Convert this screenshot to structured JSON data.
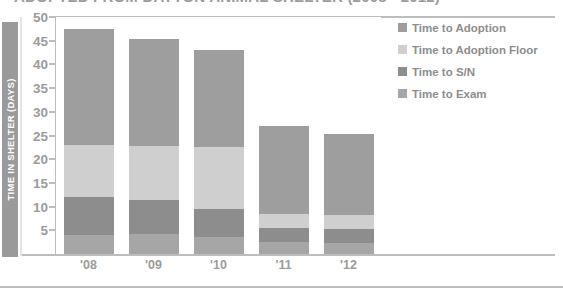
{
  "chart_data": {
    "type": "bar",
    "stacked": true,
    "title": "ADOPTED FROM DAYTON ANIMAL SHELTER (2008 - 2012)",
    "xlabel": "",
    "ylabel": "TIME IN SHELTER (DAYS)",
    "ylim": [
      0,
      50
    ],
    "ytick_step": 5,
    "yticks": [
      50,
      45,
      40,
      35,
      30,
      25,
      20,
      15,
      10,
      5
    ],
    "grid": false,
    "legend_position": "top-right",
    "categories": [
      "'08",
      "'09",
      "'10",
      "'11",
      "'12"
    ],
    "series": [
      {
        "name": "Time to Adoption",
        "color": "#9e9e9e",
        "values": [
          24.5,
          22.5,
          20.5,
          18.5,
          17.0
        ]
      },
      {
        "name": "Time to Adoption Floor",
        "color": "#cfcfcf",
        "values": [
          11.0,
          11.5,
          13.0,
          3.0,
          3.0
        ]
      },
      {
        "name": "Time to S/N",
        "color": "#8d8d8d",
        "values": [
          8.0,
          7.0,
          6.0,
          3.0,
          3.0
        ]
      },
      {
        "name": "Time to Exam",
        "color": "#a6a6a6",
        "values": [
          4.0,
          4.3,
          3.5,
          2.5,
          2.3
        ]
      }
    ],
    "totals": [
      47.5,
      45.3,
      43.0,
      27.0,
      25.3
    ]
  },
  "legend": {
    "items": [
      {
        "label": "Time to Adoption",
        "swatch": "#9e9e9e"
      },
      {
        "label": "Time to Adoption Floor",
        "swatch": "#cfcfcf"
      },
      {
        "label": "Time to S/N",
        "swatch": "#8d8d8d"
      },
      {
        "label": "Time to Exam",
        "swatch": "#a6a6a6"
      }
    ]
  },
  "colors": {
    "axis": "#bdbdbd",
    "text": "#9b9b9b",
    "ytitle_bar": "#9a9a9a",
    "ytitle_text": "#ffffff",
    "background": "#ffffff"
  }
}
